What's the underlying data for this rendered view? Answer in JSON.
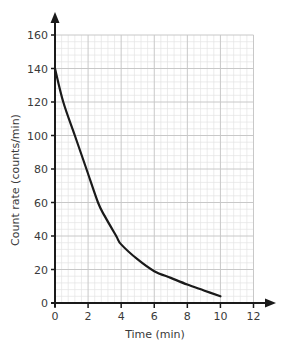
{
  "chart_data": {
    "type": "line",
    "title": "",
    "xlabel": "Time (min)",
    "ylabel": "Count rate (counts/min)",
    "xlim": [
      0,
      12
    ],
    "ylim": [
      0,
      160
    ],
    "x_ticks": [
      0,
      2,
      4,
      6,
      8,
      10,
      12
    ],
    "y_ticks": [
      0,
      20,
      40,
      60,
      80,
      100,
      120,
      140,
      160
    ],
    "grid": {
      "major": true,
      "minor": true,
      "major_x_step": 2,
      "major_y_step": 20,
      "minor_divisions": 5
    },
    "axes_arrows": true,
    "legend": null,
    "series": [
      {
        "name": "Count rate",
        "x": [
          0,
          0.5,
          1.2,
          1.9,
          2.6,
          3.0,
          3.7,
          4.0,
          5.0,
          6.0,
          7.0,
          8.0,
          9.0,
          10.0
        ],
        "values": [
          140,
          120,
          100,
          80,
          60,
          52,
          40,
          35,
          26,
          19,
          15,
          11,
          7.5,
          4
        ]
      }
    ]
  },
  "colors": {
    "curve": "#1a1a1a",
    "axis": "#1a1a1a",
    "grid_major": "#c8c8c8",
    "grid_minor": "#e4e4e4",
    "text": "#3a3a3a"
  }
}
